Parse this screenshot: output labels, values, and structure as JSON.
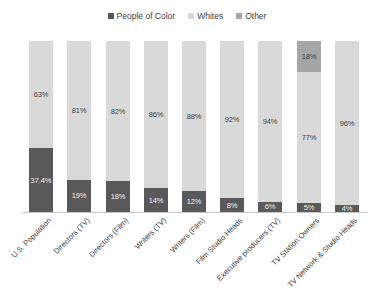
{
  "legend": {
    "position": "top-center",
    "entries": [
      {
        "label": "People of Color",
        "color": "#595959"
      },
      {
        "label": "Whites",
        "color": "#d9d9d9"
      },
      {
        "label": "Other",
        "color": "#a6a6a6"
      }
    ]
  },
  "colors": {
    "people_of_color": "#595959",
    "whites": "#d9d9d9",
    "other": "#a6a6a6",
    "axis_line": "#c8c8c8",
    "text": "#3d3d3d",
    "text_on_dark": "#f2f2f2",
    "background": "#ffffff"
  },
  "chart_data": {
    "type": "bar",
    "subtype": "stacked-100-percent",
    "title": "",
    "xlabel": "",
    "ylabel": "",
    "ylim": [
      0,
      100
    ],
    "grid": false,
    "axis_ticks_visible": false,
    "legend_position": "top-center",
    "categories": [
      "U.S. Population",
      "Directors (TV)",
      "Directors (Film)",
      "Writers (TV)",
      "Writers (Film)",
      "Film Studio Heads",
      "Executive producers (TV)",
      "TV Station Owners",
      "TV Network & Studio Heads"
    ],
    "series": [
      {
        "name": "People of Color",
        "color": "#595959",
        "values": [
          37.4,
          19,
          18,
          14,
          12,
          8,
          6,
          5,
          4
        ],
        "labels": [
          "37.4%",
          "19%",
          "18%",
          "14%",
          "12%",
          "8%",
          "6%",
          "5%",
          "4%"
        ]
      },
      {
        "name": "Whites",
        "color": "#d9d9d9",
        "values": [
          63,
          81,
          82,
          86,
          88,
          92,
          94,
          77,
          96
        ],
        "labels": [
          "63%",
          "81%",
          "82%",
          "86%",
          "88%",
          "92%",
          "94%",
          "77%",
          "96%"
        ]
      },
      {
        "name": "Other",
        "color": "#a6a6a6",
        "values": [
          0,
          0,
          0,
          0,
          0,
          0,
          0,
          18,
          0
        ],
        "labels": [
          "",
          "",
          "",
          "",
          "",
          "",
          "",
          "18%",
          ""
        ]
      }
    ]
  }
}
